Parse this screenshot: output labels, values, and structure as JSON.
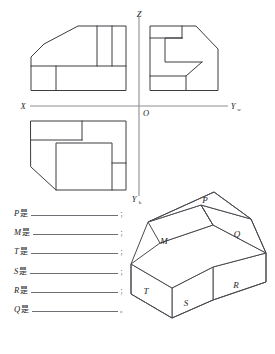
{
  "page": {
    "kind": "engineering-drawing-exercise",
    "background_color": "#ffffff",
    "line_color": "#3c3c42",
    "axis_color": "#8d8d93"
  },
  "axes": {
    "x_label": "X",
    "z_label": "Z",
    "origin_label": "O",
    "y_w_label": "Y",
    "y_w_subscript": "w",
    "y_h_label": "Y",
    "y_h_subscript": "h"
  },
  "views": {
    "front": {
      "name": "front-view",
      "position": "upper-left-quadrant",
      "outline": "31,90 31,57 44,44 78,26 126,26 126,90",
      "internal_lines": [
        "31,66 126,66",
        "56,66 56,90",
        "97,26 97,66",
        "112,26 112,66"
      ]
    },
    "side": {
      "name": "side-view",
      "position": "upper-right-quadrant",
      "outline": "150,90 150,26 196,26 218,49 218,90",
      "internal_lines": [
        "150,38 182,38",
        "165,38 165,62",
        "165,62 202,62",
        "150,76 186,76",
        "186,76 202,62",
        "186,76 186,90"
      ]
    },
    "top": {
      "name": "top-view",
      "position": "lower-left-quadrant",
      "outline": "31,121 126,121 126,190 56,190 31,167",
      "internal_lines": [
        "31,140 82,140",
        "82,121 82,140",
        "56,143 56,190",
        "56,143 112,143",
        "112,143 112,190",
        "112,163 126,163"
      ]
    }
  },
  "solid": {
    "name": "isometric-solid",
    "labels": [
      {
        "text": "P",
        "x": 205,
        "y": 203
      },
      {
        "text": "Q",
        "x": 235,
        "y": 236
      },
      {
        "text": "M",
        "x": 165,
        "y": 243
      },
      {
        "text": "R",
        "x": 235,
        "y": 287
      },
      {
        "text": "S",
        "x": 186,
        "y": 305
      },
      {
        "text": "T",
        "x": 145,
        "y": 293
      }
    ]
  },
  "answers": {
    "is_word": "是",
    "rows": [
      {
        "key": "P",
        "blank": "",
        "end": "；"
      },
      {
        "key": "M",
        "blank": "",
        "end": "；"
      },
      {
        "key": "T",
        "blank": "",
        "end": "；"
      },
      {
        "key": "S",
        "blank": "",
        "end": "；"
      },
      {
        "key": "R",
        "blank": "",
        "end": "；"
      },
      {
        "key": "Q",
        "blank": "",
        "end": "。"
      }
    ]
  }
}
